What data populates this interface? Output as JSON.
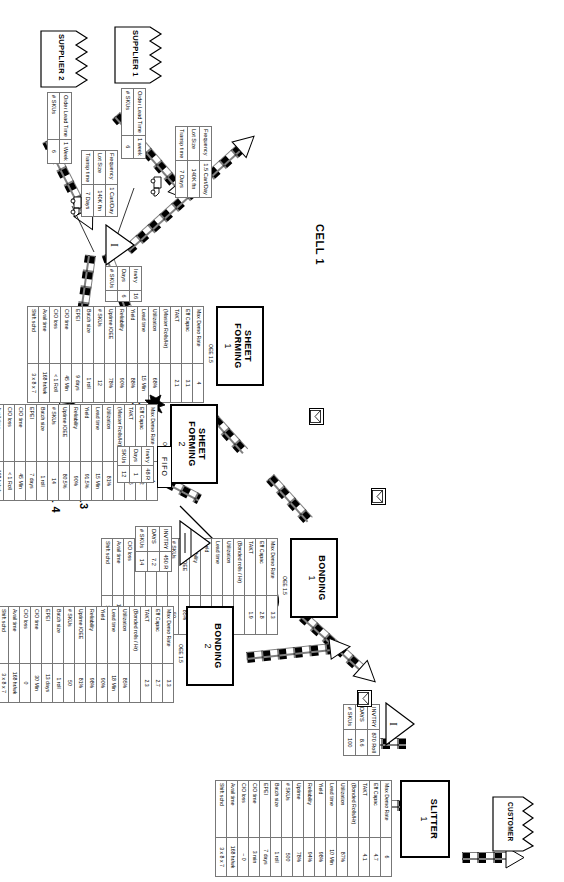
{
  "diagram": {
    "cells": [
      {
        "id": "cell1",
        "label": "CELL 1"
      },
      {
        "id": "cell2",
        "label": "CELL 2"
      },
      {
        "id": "cell34",
        "label": "CELL3 &\nCELL 4"
      }
    ],
    "cell3_line1": "CELL3",
    "cell3_amp": "&",
    "cell3_line2": "CELL 4"
  },
  "suppliers": [
    {
      "name": "SUPPLIER 1",
      "table": [
        {
          "k": "Order Lead Time",
          "v": "1 week"
        },
        {
          "k": "# SKUs",
          "v": "6"
        }
      ],
      "shipping": [
        {
          "k": "Frequency",
          "v": "1.5 Cart/Day"
        },
        {
          "k": "Lot Size",
          "v": "140K ftn"
        },
        {
          "k": "Transp time",
          "v": "7 Days"
        }
      ]
    },
    {
      "name": "SUPPLIER 2",
      "table": [
        {
          "k": "Order Lead Time",
          "v": "1 Week"
        },
        {
          "k": "# SKUs",
          "v": "6"
        }
      ],
      "shipping": [
        {
          "k": "Frequency",
          "v": "1 Cart/Day"
        },
        {
          "k": "Lot Size",
          "v": "140K ftn"
        },
        {
          "k": "Transp time",
          "v": "7 Days"
        }
      ]
    }
  ],
  "customer": {
    "label": "CUSTOMER"
  },
  "processes": [
    {
      "id": "sheet_forming_1",
      "name": "SHEET FORMING",
      "num": "1",
      "oee": "OEE 1.5",
      "rows": [
        {
          "k": "Max Demo Rate",
          "v": "4"
        },
        {
          "k": "Eff Capac",
          "v": "3.1"
        },
        {
          "k": "TAKT",
          "v": "2.1"
        },
        {
          "k": "(Master Rolls/Hr)",
          "v": ""
        },
        {
          "k": "Utilization",
          "v": "68%"
        },
        {
          "k": "Lead time",
          "v": "15 Min"
        },
        {
          "k": "Yield",
          "v": "88%"
        },
        {
          "k": "Reliability",
          "v": "90%"
        },
        {
          "k": "Uptime /OEE",
          "v": "78%"
        },
        {
          "k": "# SKUs",
          "v": "12"
        },
        {
          "k": "Batch size",
          "v": "1 roll"
        },
        {
          "k": "EPEI",
          "v": "9 days"
        },
        {
          "k": "C/O time",
          "v": "45 Min"
        },
        {
          "k": "C/O loss",
          "v": "< 1 Roll"
        },
        {
          "k": "Avail time",
          "v": "168 hr/wk"
        },
        {
          "k": "Shift schd",
          "v": "3 x 8 x 7"
        }
      ]
    },
    {
      "id": "sheet_forming_2",
      "name": "SHEET FORMING",
      "num": "2",
      "oee": "OEE 1.5",
      "rows": [
        {
          "k": "Max Demo Rate",
          "v": "4"
        },
        {
          "k": "Eff Capac",
          "v": "3.2"
        },
        {
          "k": "TAKT",
          "v": "2.6"
        },
        {
          "k": "(Master Rolls/Hr)",
          "v": ""
        },
        {
          "k": "Utilization",
          "v": "81%"
        },
        {
          "k": "Lead time",
          "v": "15 Min"
        },
        {
          "k": "Yield",
          "v": "91.5%"
        },
        {
          "k": "Reliability",
          "v": "90%"
        },
        {
          "k": "Uptime /OEE",
          "v": "80.5%"
        },
        {
          "k": "# SKUs",
          "v": "14"
        },
        {
          "k": "Batch size",
          "v": "1 roll"
        },
        {
          "k": "EPEI",
          "v": "7 days"
        },
        {
          "k": "C/O time",
          "v": "45 Min"
        },
        {
          "k": "C/O loss",
          "v": "< 1 Roll"
        },
        {
          "k": "Avail time",
          "v": "168 hr/wk"
        },
        {
          "k": "Shift schd",
          "v": "3 x 8 x 7"
        }
      ]
    },
    {
      "id": "bonding_1",
      "name": "BONDING",
      "num": "1",
      "oee": "OEE 1.5",
      "rows": [
        {
          "k": "Max Demo Rate",
          "v": "3.3"
        },
        {
          "k": "Eff Capac",
          "v": "2.8"
        },
        {
          "k": "TAKT",
          "v": "1.9"
        },
        {
          "k": "(Bonded rolls / Hr)",
          "v": ""
        },
        {
          "k": "Utilization",
          "v": "68%"
        },
        {
          "k": "Lead time",
          "v": "18 Min"
        },
        {
          "k": "Yield",
          "v": "92%"
        },
        {
          "k": "Reliability",
          "v": "98%"
        },
        {
          "k": "Uptime /OEE",
          "v": "85%"
        },
        {
          "k": "# SKUs",
          "v": "50"
        },
        {
          "k": "Batch size",
          "v": "1 roll"
        },
        {
          "k": "EPEI",
          "v": "10 days"
        },
        {
          "k": "C/O time",
          "v": "15 Min"
        },
        {
          "k": "C/O loss",
          "v": "0"
        },
        {
          "k": "Avail time",
          "v": "168 hr/wk"
        },
        {
          "k": "Shift schd",
          "v": "3 x 8 x 7"
        }
      ]
    },
    {
      "id": "bonding_2",
      "name": "BONDING",
      "num": "2",
      "oee": "OEE 1.5",
      "rows": [
        {
          "k": "Max Demo Rate",
          "v": "3.3"
        },
        {
          "k": "Eff Capac",
          "v": "2.7"
        },
        {
          "k": "TAKT",
          "v": "2.3"
        },
        {
          "k": "(Bonded rolls / Hr)",
          "v": ""
        },
        {
          "k": "Utilization",
          "v": "85%"
        },
        {
          "k": "Lead time",
          "v": "18 Min"
        },
        {
          "k": "Yield",
          "v": "90%"
        },
        {
          "k": "Reliability",
          "v": "98%"
        },
        {
          "k": "Uptime /OEE",
          "v": "81%"
        },
        {
          "k": "# SKUs",
          "v": "50"
        },
        {
          "k": "Batch size",
          "v": "1 roll"
        },
        {
          "k": "EPEI",
          "v": "13 days"
        },
        {
          "k": "C/O time",
          "v": "30 Min"
        },
        {
          "k": "C/O loss",
          "v": "0"
        },
        {
          "k": "Avail time",
          "v": "168 hr/wk"
        },
        {
          "k": "Shift schd",
          "v": "3 x 8 x 7"
        }
      ]
    },
    {
      "id": "slitter",
      "name": "SLITTER",
      "num": "1",
      "oee": "",
      "rows": [
        {
          "k": "Max Demo Rate",
          "v": "6"
        },
        {
          "k": "Eff Capac",
          "v": "4.7"
        },
        {
          "k": "TAKT",
          "v": "4.1"
        },
        {
          "k": "(Bonded Rolls/Hr)",
          "v": ""
        },
        {
          "k": "Utilization",
          "v": "87%"
        },
        {
          "k": "Lead time",
          "v": "10 Min"
        },
        {
          "k": "Yield",
          "v": "98%"
        },
        {
          "k": "Reliability",
          "v": "94%"
        },
        {
          "k": "Uptime",
          "v": "78%"
        },
        {
          "k": "# SKUs",
          "v": "500"
        },
        {
          "k": "Batch size",
          "v": "1 roll"
        },
        {
          "k": "EPEI",
          "v": "7 days"
        },
        {
          "k": "C/O time",
          "v": "3 min"
        },
        {
          "k": "C/O loss",
          "v": "~ 0"
        },
        {
          "k": "Avail time",
          "v": "168 hr/wk"
        },
        {
          "k": "Shift schd",
          "v": "3 x 8 x 7"
        }
      ]
    }
  ],
  "inventories": [
    {
      "id": "inv_raw",
      "letter": "I",
      "rows": [
        {
          "k": "Invtry",
          "v": "16"
        },
        {
          "k": "Days",
          "v": "6"
        },
        {
          "k": "# SKUs",
          "v": ""
        }
      ],
      "rows_alt": [
        {
          "k": "Invtry",
          "v": "16"
        },
        {
          "k": "Days",
          "v": "6"
        },
        {
          "k": "# SKUs",
          "v": ""
        }
      ]
    },
    {
      "id": "inv_wip",
      "letter": "I",
      "rows": [
        {
          "k": "INVTRY",
          "v": "450 R"
        },
        {
          "k": "DAYS",
          "v": "7.2"
        },
        {
          "k": "# SKUs",
          "v": "14"
        }
      ]
    },
    {
      "id": "inv_fg",
      "letter": "I",
      "rows": [
        {
          "k": "INVTRY",
          "v": "870 Roll"
        },
        {
          "k": "DAYS",
          "v": "8.6"
        },
        {
          "k": "# SKUs",
          "v": "100"
        }
      ]
    }
  ],
  "inv_raw_table": [
    {
      "k": "Invtry",
      "v": "16"
    },
    {
      "k": "Days",
      "v": "6"
    },
    {
      "k": "# SKUs",
      "v": ""
    }
  ],
  "fifo": {
    "label": "FIFO",
    "rows": [
      {
        "k": "Invtry",
        "v": "48 R"
      },
      {
        "k": "Days",
        "v": "1"
      },
      {
        "k": "SKUs",
        "v": "12"
      }
    ]
  },
  "icons": {
    "factory": "factory-icon",
    "truck": "truck-icon",
    "mail": "mail-icon",
    "inventory": "inventory-triangle-icon",
    "kaizen": "kaizen-burst-icon",
    "push": "push-arrow-icon",
    "operator": "operator-icon"
  },
  "colors": {
    "line": "#000000",
    "fill": "#ffffff",
    "grid": "#777777"
  }
}
